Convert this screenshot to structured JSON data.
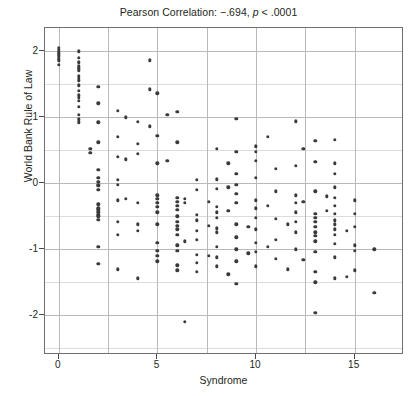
{
  "chart_data": {
    "type": "scatter",
    "title": "Pearson Correlation: −.694, p < .0001",
    "title_parts": {
      "prefix": "Pearson Correlation: −.694, ",
      "italic": "p",
      "suffix": " < .0001"
    },
    "xlabel": "Syndrome",
    "ylabel": "World Bank Rule of Law",
    "xlim": [
      -0.7,
      17.5
    ],
    "ylim": [
      -2.6,
      2.35
    ],
    "xticks": [
      0,
      5,
      10,
      15
    ],
    "yticks": [
      2,
      1,
      0,
      -1,
      -2
    ],
    "xtick_labels": [
      "0",
      "5",
      "10",
      "15"
    ],
    "ytick_labels": [
      "2",
      "1",
      "0",
      "-1",
      "-2"
    ],
    "x_major_gridlines": [
      0,
      2.5,
      5,
      7.5,
      10,
      12.5,
      15
    ],
    "y_major_gridlines": [
      2,
      1,
      0,
      -1,
      -2
    ],
    "y_minor_gridlines": [
      1.5,
      0.5,
      -0.5,
      -1.5,
      -2.5
    ],
    "grid": true,
    "legend": false,
    "point_color": "#3a3a3a",
    "correlation": -0.694,
    "p_value": "< .0001",
    "n_points": 196,
    "points": [
      [
        0,
        2.05
      ],
      [
        0,
        1.98
      ],
      [
        0,
        1.92
      ],
      [
        0,
        1.86
      ],
      [
        0,
        1.79
      ],
      [
        0,
        1.95
      ],
      [
        0,
        2.02
      ],
      [
        0,
        1.88
      ],
      [
        1,
        2.0
      ],
      [
        1,
        1.9
      ],
      [
        1,
        1.84
      ],
      [
        1,
        1.77
      ],
      [
        1,
        1.71
      ],
      [
        1,
        1.63
      ],
      [
        1,
        1.56
      ],
      [
        1,
        1.48
      ],
      [
        1,
        1.4
      ],
      [
        1,
        1.33
      ],
      [
        1,
        1.25
      ],
      [
        1,
        1.16
      ],
      [
        1,
        1.04
      ],
      [
        1,
        0.97
      ],
      [
        1,
        0.92
      ],
      [
        1,
        1.82
      ],
      [
        1,
        1.74
      ],
      [
        1,
        1.6
      ],
      [
        1,
        1.29
      ],
      [
        2,
        1.46
      ],
      [
        2,
        1.21
      ],
      [
        2,
        0.92
      ],
      [
        2,
        0.62
      ],
      [
        2,
        0.2
      ],
      [
        2,
        0.02
      ],
      [
        2,
        -0.04
      ],
      [
        2,
        -0.1
      ],
      [
        2,
        -0.32
      ],
      [
        2,
        -0.4
      ],
      [
        2,
        -0.44
      ],
      [
        2,
        -0.48
      ],
      [
        2,
        -0.55
      ],
      [
        2,
        0.08
      ],
      [
        2,
        -0.02
      ],
      [
        2,
        -0.38
      ],
      [
        2,
        -0.5
      ],
      [
        2,
        -0.96
      ],
      [
        2,
        -1.22
      ],
      [
        1.6,
        0.52
      ],
      [
        1.6,
        0.46
      ],
      [
        3,
        1.1
      ],
      [
        3,
        0.7
      ],
      [
        3,
        0.4
      ],
      [
        3,
        0.05
      ],
      [
        3,
        -0.02
      ],
      [
        3,
        -0.26
      ],
      [
        3,
        -0.58
      ],
      [
        3,
        -0.78
      ],
      [
        3,
        -1.3
      ],
      [
        3.4,
        1.0
      ],
      [
        3.4,
        0.36
      ],
      [
        3.4,
        -0.24
      ],
      [
        4,
        0.93
      ],
      [
        4,
        0.6
      ],
      [
        4,
        0.45
      ],
      [
        4,
        -0.3
      ],
      [
        4,
        -0.62
      ],
      [
        4,
        -0.72
      ],
      [
        4,
        -1.44
      ],
      [
        4.6,
        1.86
      ],
      [
        4.6,
        1.42
      ],
      [
        4.6,
        0.86
      ],
      [
        5,
        1.36
      ],
      [
        5,
        0.72
      ],
      [
        5,
        0.3
      ],
      [
        5,
        -0.18
      ],
      [
        5,
        -0.24
      ],
      [
        5,
        -0.3
      ],
      [
        5,
        -0.36
      ],
      [
        5,
        -0.62
      ],
      [
        5,
        -0.9
      ],
      [
        5,
        -1.02
      ],
      [
        5,
        -1.1
      ],
      [
        5,
        -1.18
      ],
      [
        5,
        -0.44
      ],
      [
        5.5,
        1.04
      ],
      [
        5.5,
        0.34
      ],
      [
        6,
        1.08
      ],
      [
        6,
        0.62
      ],
      [
        6,
        -0.22
      ],
      [
        6,
        -0.28
      ],
      [
        6,
        -0.34
      ],
      [
        6,
        -0.4
      ],
      [
        6,
        -0.5
      ],
      [
        6,
        -0.58
      ],
      [
        6,
        -0.64
      ],
      [
        6,
        -0.7
      ],
      [
        6,
        -0.78
      ],
      [
        6,
        -0.94
      ],
      [
        6,
        -1.02
      ],
      [
        6,
        -1.24
      ],
      [
        6,
        -1.32
      ],
      [
        6.4,
        -0.24
      ],
      [
        6.4,
        -0.3
      ],
      [
        6.4,
        -0.88
      ],
      [
        6.4,
        -2.1
      ],
      [
        7,
        0.05
      ],
      [
        7,
        -0.1
      ],
      [
        7,
        -0.48
      ],
      [
        7,
        -0.56
      ],
      [
        7,
        -0.72
      ],
      [
        7,
        -0.86
      ],
      [
        7,
        -1.08
      ],
      [
        7,
        -1.2
      ],
      [
        7,
        -1.34
      ],
      [
        7.6,
        -0.28
      ],
      [
        7.6,
        -0.64
      ],
      [
        7.6,
        -1.1
      ],
      [
        8,
        0.52
      ],
      [
        8,
        0.06
      ],
      [
        8,
        -0.08
      ],
      [
        8,
        -0.36
      ],
      [
        8,
        -0.44
      ],
      [
        8,
        -0.52
      ],
      [
        8,
        -0.68
      ],
      [
        8,
        -0.74
      ],
      [
        8,
        -0.96
      ],
      [
        8,
        -1.12
      ],
      [
        8,
        -1.26
      ],
      [
        8.6,
        0.3
      ],
      [
        8.6,
        -0.06
      ],
      [
        8.6,
        -0.42
      ],
      [
        8.6,
        -1.38
      ],
      [
        9,
        0.98
      ],
      [
        9,
        0.48
      ],
      [
        9,
        0.14
      ],
      [
        9,
        -0.02
      ],
      [
        9,
        -0.16
      ],
      [
        9,
        -0.3
      ],
      [
        9,
        -0.62
      ],
      [
        9,
        -0.82
      ],
      [
        9,
        -1.0
      ],
      [
        9,
        -1.18
      ],
      [
        9,
        -1.52
      ],
      [
        9.6,
        -0.66
      ],
      [
        9.6,
        -1.06
      ],
      [
        10,
        0.56
      ],
      [
        10,
        0.48
      ],
      [
        10,
        0.34
      ],
      [
        10,
        0.08
      ],
      [
        10,
        -0.26
      ],
      [
        10,
        -0.38
      ],
      [
        10,
        -0.52
      ],
      [
        10,
        -0.7
      ],
      [
        10,
        -0.9
      ],
      [
        10,
        -1.04
      ],
      [
        10,
        -1.26
      ],
      [
        10.6,
        0.7
      ],
      [
        10.6,
        -0.34
      ],
      [
        10.6,
        -0.96
      ],
      [
        11,
        0.22
      ],
      [
        11,
        -0.12
      ],
      [
        11,
        -0.54
      ],
      [
        11,
        -0.86
      ],
      [
        11,
        -1.14
      ],
      [
        11.6,
        -0.62
      ],
      [
        11.6,
        -1.3
      ],
      [
        12,
        0.94
      ],
      [
        12,
        0.26
      ],
      [
        12,
        -0.18
      ],
      [
        12,
        -0.3
      ],
      [
        12,
        -0.44
      ],
      [
        12,
        -0.58
      ],
      [
        12,
        -0.74
      ],
      [
        12,
        -1.0
      ],
      [
        12.4,
        0.52
      ],
      [
        12.4,
        -0.28
      ],
      [
        12.4,
        -1.16
      ],
      [
        13,
        0.64
      ],
      [
        13,
        0.32
      ],
      [
        13,
        -0.12
      ],
      [
        13,
        -0.46
      ],
      [
        13,
        -0.52
      ],
      [
        13,
        -0.58
      ],
      [
        13,
        -0.66
      ],
      [
        13,
        -0.74
      ],
      [
        13,
        -0.8
      ],
      [
        13,
        -0.88
      ],
      [
        13,
        -1.04
      ],
      [
        13,
        -1.34
      ],
      [
        13,
        -1.5
      ],
      [
        13,
        -1.96
      ],
      [
        13.6,
        -0.2
      ],
      [
        13.6,
        -0.42
      ],
      [
        14,
        0.66
      ],
      [
        14,
        0.3
      ],
      [
        14,
        0.14
      ],
      [
        14,
        -0.06
      ],
      [
        14,
        -0.22
      ],
      [
        14,
        -0.34
      ],
      [
        14,
        -0.46
      ],
      [
        14,
        -0.56
      ],
      [
        14,
        -0.62
      ],
      [
        14,
        -0.7
      ],
      [
        14,
        -0.78
      ],
      [
        14,
        -0.92
      ],
      [
        14,
        -1.12
      ],
      [
        14,
        -1.44
      ],
      [
        14.6,
        -0.72
      ],
      [
        14.6,
        -1.42
      ],
      [
        15,
        -0.26
      ],
      [
        15,
        -0.46
      ],
      [
        15,
        -0.66
      ],
      [
        15,
        -0.94
      ],
      [
        15,
        -1.02
      ],
      [
        15,
        -1.32
      ],
      [
        16,
        -1.0
      ],
      [
        16,
        -1.66
      ]
    ]
  }
}
